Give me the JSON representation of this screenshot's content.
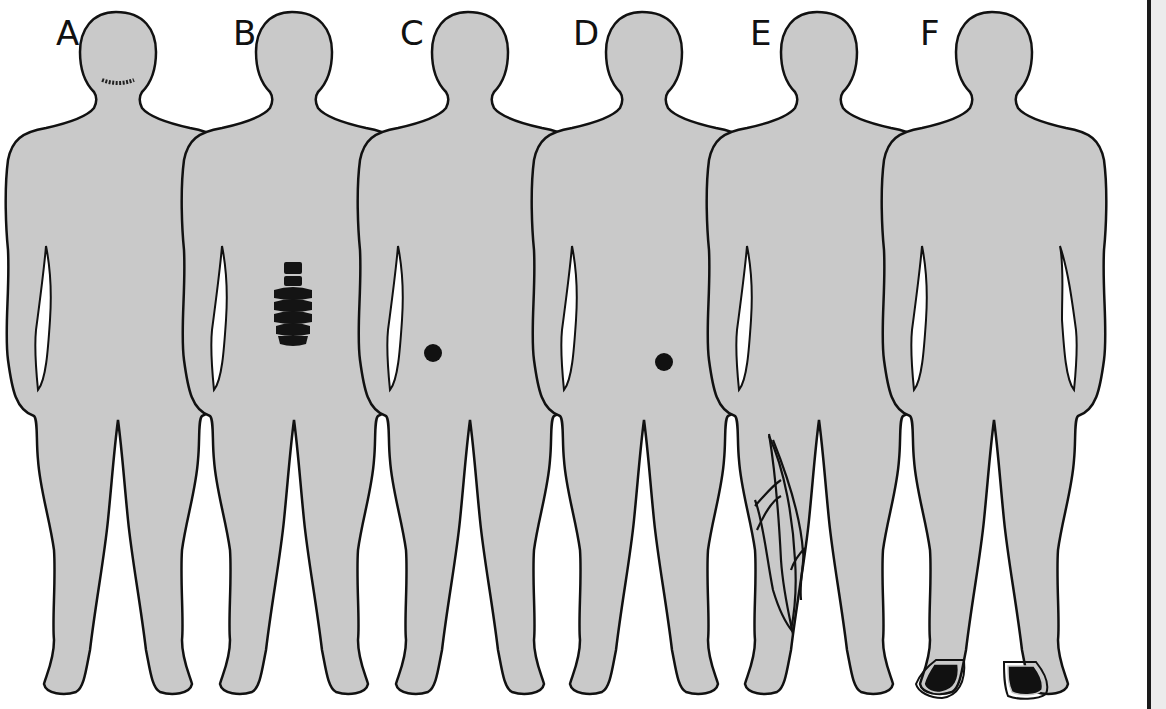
{
  "figure": {
    "silhouette_fill": "#c9c9c9",
    "outline_color": "#111111",
    "marker_color": "#111111",
    "panels": [
      {
        "label": "A",
        "marker": "neck-scar",
        "x": 0
      },
      {
        "label": "B",
        "marker": "lumbar-spine",
        "x": 176
      },
      {
        "label": "C",
        "marker": "right-groin-dot",
        "x": 350
      },
      {
        "label": "D",
        "marker": "left-groin-dot",
        "x": 526
      },
      {
        "label": "E",
        "marker": "leg-veins",
        "x": 700
      },
      {
        "label": "F",
        "marker": "feet",
        "x": 875
      }
    ]
  }
}
